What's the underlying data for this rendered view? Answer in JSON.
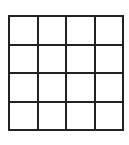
{
  "puzzle": {
    "heading": "32",
    "rows": 4,
    "cols": 4,
    "cells": [
      [
        "",
        "",
        "",
        ""
      ],
      [
        "",
        "",
        "",
        ""
      ],
      [
        "",
        "",
        "",
        ""
      ],
      [
        "",
        "",
        "",
        ""
      ]
    ],
    "line_color": "#222222",
    "background": "#ffffff"
  }
}
